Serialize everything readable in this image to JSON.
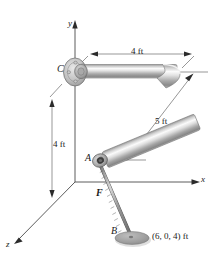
{
  "figure": {
    "type": "engineering-statics-diagram",
    "background_color": "#ffffff",
    "pipe_color_light": "#f4f4f4",
    "pipe_color_mid": "#b8b8b8",
    "pipe_color_dark": "#6e6e6e",
    "line_color": "#3a3a3a",
    "cable_color": "#8a8a8a",
    "disc_color": "#9a9a9a"
  },
  "axes": [
    {
      "name": "y-axis",
      "label": "y"
    },
    {
      "name": "x-axis",
      "label": "x"
    },
    {
      "name": "z-axis",
      "label": "z"
    }
  ],
  "points": [
    {
      "name": "point-c",
      "label": "C"
    },
    {
      "name": "point-a",
      "label": "A"
    },
    {
      "name": "point-b",
      "label": "B"
    }
  ],
  "force": {
    "label": "F"
  },
  "dimensions": [
    {
      "name": "dimension-horizontal-top",
      "label": "4 ft"
    },
    {
      "name": "dimension-vertical-left",
      "label": "4 ft"
    },
    {
      "name": "dimension-diagonal",
      "label": "5 ft"
    }
  ],
  "coordinate_annotation": {
    "label": "(6, 0, 4) ft"
  }
}
